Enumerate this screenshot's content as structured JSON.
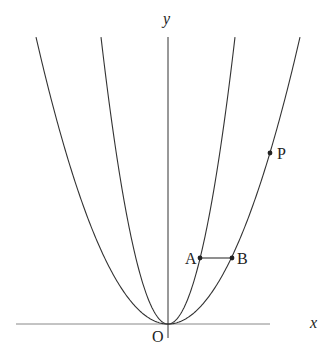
{
  "diagram": {
    "type": "parabolas",
    "axes": {
      "x_label": "x",
      "y_label": "y",
      "origin_label": "O"
    },
    "curves": [
      {
        "name": "inner-parabola",
        "description": "narrower parabola y = a x^2"
      },
      {
        "name": "outer-parabola",
        "description": "wider parabola y = b x^2"
      }
    ],
    "points": [
      {
        "label": "A",
        "on": "inner-parabola"
      },
      {
        "label": "B",
        "on": "outer-parabola"
      },
      {
        "label": "P",
        "on": "outer-parabola"
      }
    ],
    "segments": [
      {
        "from": "A",
        "to": "B",
        "note": "horizontal segment"
      }
    ],
    "colors": {
      "stroke": "#333333",
      "axis_x": "#777777",
      "background": "#ffffff"
    }
  }
}
